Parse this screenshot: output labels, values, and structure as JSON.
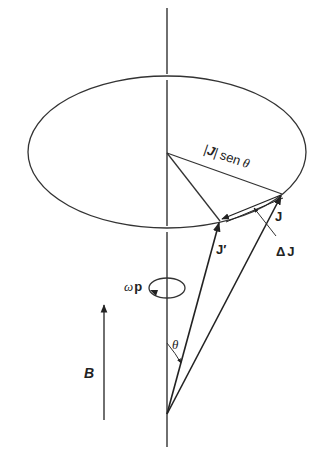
{
  "diagram": {
    "colors": {
      "stroke": "#333333",
      "background": "#ffffff"
    },
    "labels": {
      "radius": "|J| sen θ",
      "radius_abs_open": "|",
      "radius_J": "J",
      "radius_abs_close": "|",
      "radius_sen": "sen",
      "radius_theta": "θ",
      "J": "J",
      "J_prime": "J′",
      "delta_J": "ΔJ",
      "delta": "Δ",
      "delta_J_J": "J",
      "omega_p_omega": "ω",
      "omega_p_p": "p",
      "theta": "θ",
      "B": "B"
    },
    "elements": [
      "vertical-axis",
      "precession-circle",
      "radius-line",
      "vector-J",
      "vector-J-prime",
      "vector-delta-J",
      "omega-p-rotation",
      "theta-angle-arc",
      "B-field-arrow"
    ]
  }
}
